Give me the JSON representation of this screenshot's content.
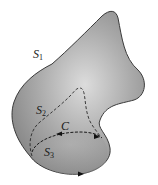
{
  "figure": {
    "type": "surfaces sharing a boundary curve",
    "labels": {
      "s1": {
        "base": "S",
        "sub": "1"
      },
      "s2": {
        "base": "S",
        "sub": "2"
      },
      "s3": {
        "base": "S",
        "sub": "3"
      },
      "c": {
        "base": "C",
        "sub": ""
      }
    },
    "colors": {
      "surface_light": "#d8d8d8",
      "surface_dark": "#8a8a8a",
      "outline": "#3a3a3a",
      "dashed": "#2a2a2a",
      "background": "#ffffff"
    }
  }
}
